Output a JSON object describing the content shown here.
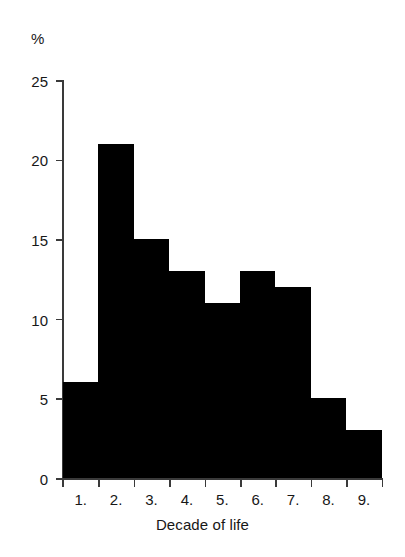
{
  "chart_data": {
    "type": "bar",
    "title": "",
    "subtitle": "",
    "xlabel": "Decade of life",
    "ylabel": "%",
    "categories": [
      "1.",
      "2.",
      "3.",
      "4.",
      "5.",
      "6.",
      "7.",
      "8.",
      "9."
    ],
    "values": [
      6,
      21,
      15,
      13,
      11,
      13,
      12,
      5,
      3
    ],
    "series": [
      {
        "name": "Percent of cases",
        "values": [
          6,
          21,
          15,
          13,
          11,
          13,
          12,
          5,
          3
        ]
      }
    ],
    "ylim": [
      0,
      25
    ],
    "yticks": [
      0,
      5,
      10,
      15,
      20,
      25
    ],
    "ytick_labels": [
      "0",
      "5",
      "10",
      "15",
      "20",
      "25"
    ],
    "xtick_labels": [
      "1.",
      "2.",
      "3.",
      "4.",
      "5.",
      "6.",
      "7.",
      "8.",
      "9."
    ],
    "grid": false,
    "legend": false,
    "legend_position": "none",
    "bar_color": "#000000",
    "axis_color": "#3a3a3a",
    "background_color": "#ffffff",
    "style": "histogram, contiguous bars, no gaps"
  }
}
